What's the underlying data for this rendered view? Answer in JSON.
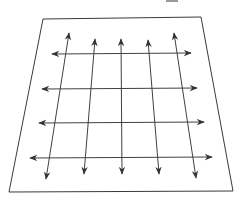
{
  "diagram": {
    "colors": {
      "background": "#ffffff",
      "plane_stroke": "#3a3a3a",
      "arrow_stroke": "#404040",
      "arrowhead_fill": "#333333"
    },
    "plane": {
      "shape": "trapezoid",
      "corners": [
        [
          43,
          19
        ],
        [
          201,
          17
        ],
        [
          233,
          191
        ],
        [
          9,
          192
        ]
      ]
    },
    "horizontal_arrows": [
      {
        "from": [
          52,
          54
        ],
        "to": [
          191,
          53
        ]
      },
      {
        "from": [
          42,
          89
        ],
        "to": [
          197,
          88
        ]
      },
      {
        "from": [
          39,
          123
        ],
        "to": [
          204,
          122
        ]
      },
      {
        "from": [
          30,
          158
        ],
        "to": [
          212,
          157
        ]
      }
    ],
    "vertical_arrows": [
      {
        "from": [
          69,
          33
        ],
        "to": [
          46,
          179
        ]
      },
      {
        "from": [
          95,
          39
        ],
        "to": [
          84,
          174
        ]
      },
      {
        "from": [
          121,
          39
        ],
        "to": [
          122,
          174
        ]
      },
      {
        "from": [
          148,
          40
        ],
        "to": [
          159,
          174
        ]
      },
      {
        "from": [
          174,
          33
        ],
        "to": [
          196,
          178
        ]
      }
    ],
    "arrow_style": "double-headed",
    "grid_rows": 4,
    "grid_columns": 5
  }
}
